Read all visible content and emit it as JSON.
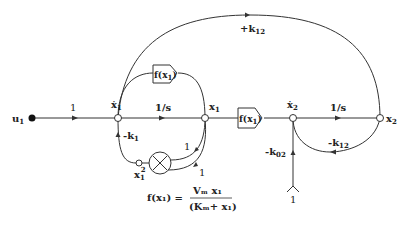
{
  "diagram": {
    "type": "signal-flow-graph",
    "colors": {
      "line": "#333333",
      "background": "#ffffff"
    },
    "nodes": {
      "u1": {
        "label": "u",
        "sub": "1"
      },
      "x1dot": {
        "label": "ẋ",
        "sub": "1"
      },
      "x1": {
        "label": "x",
        "sub": "1"
      },
      "x2dot": {
        "label": "ẋ",
        "sub": "2"
      },
      "x2": {
        "label": "x",
        "sub": "2"
      },
      "x1sq": {
        "label": "x",
        "sub": "1",
        "sup": "2"
      },
      "source": {
        "label": "1"
      }
    },
    "edges": {
      "u1_to_x1dot": "1",
      "integrator1": "1/s",
      "integrator2": "1/s",
      "feedback_k1": {
        "label": "-k",
        "sub": "1"
      },
      "feedback_k12_top": {
        "label": "+k",
        "sub": "12"
      },
      "feedback_k12_loop": {
        "label": "-k",
        "sub": "12"
      },
      "feedback_k02": {
        "label": "-k",
        "sub": "02"
      },
      "mult_in_a": "1",
      "mult_in_b": "1"
    },
    "blocks": {
      "f_top": {
        "label": "f(x",
        "sub": "1",
        "close": ")"
      },
      "f_mid": {
        "label": "f(x",
        "sub": "1",
        "close": ")"
      }
    },
    "equation": {
      "lhs": "f(x₁) =",
      "numerator": "Vₘ x₁",
      "denominator": "(Kₘ+ x₁)"
    }
  }
}
